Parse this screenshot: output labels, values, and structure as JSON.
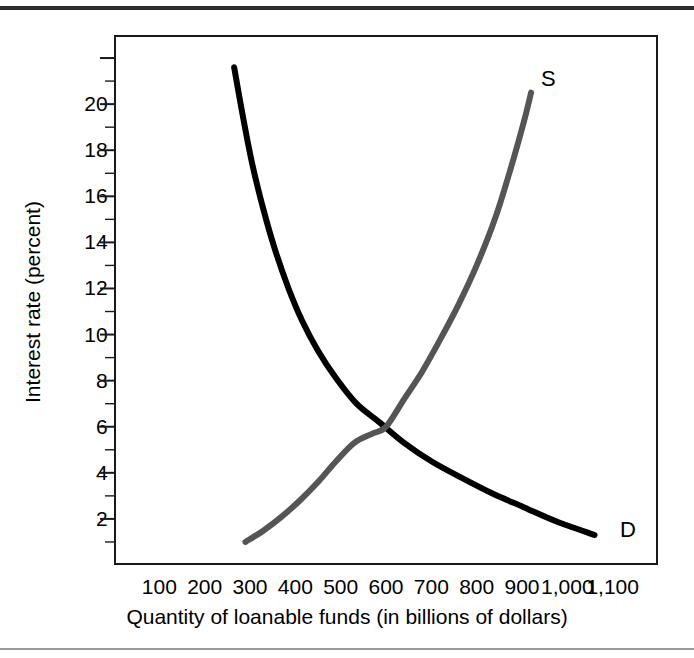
{
  "figure": {
    "background": "#ffffff",
    "frame_color": "#1a1a1a",
    "grid_color": "#4a4a4a",
    "rule_top_color": "#2e2e2e",
    "rule_bottom_color": "#9a9a9a"
  },
  "chart_data": {
    "type": "line",
    "title": "",
    "xlabel": "Quantity of loanable funds (in billions of dollars)",
    "ylabel": "Interest rate (percent)",
    "xlim": [
      0,
      1200
    ],
    "ylim": [
      0,
      23
    ],
    "grid": true,
    "grid_x_step": 50,
    "grid_y_step": 1,
    "legend": "inline-curve-labels",
    "xticks": [
      100,
      200,
      300,
      400,
      500,
      600,
      700,
      800,
      900,
      1000,
      1100
    ],
    "xtick_labels": [
      "100",
      "200",
      "300",
      "400",
      "500",
      "600",
      "700",
      "800",
      "900",
      "1,000",
      "1,100"
    ],
    "yticks": [
      2,
      4,
      6,
      8,
      10,
      12,
      14,
      16,
      18,
      20
    ],
    "ytick_labels": [
      "2",
      "4",
      "6",
      "8",
      "10",
      "12",
      "14",
      "16",
      "18",
      "20"
    ],
    "equilibrium": {
      "quantity": 600,
      "interest_rate": 6
    },
    "series": [
      {
        "name": "D",
        "label": "D",
        "description": "Demand for loanable funds",
        "color": "#000000",
        "width": 6,
        "points": [
          [
            265,
            21.6
          ],
          [
            285,
            19.4
          ],
          [
            305,
            17.4
          ],
          [
            330,
            15.4
          ],
          [
            355,
            13.7
          ],
          [
            385,
            12.0
          ],
          [
            415,
            10.6
          ],
          [
            450,
            9.3
          ],
          [
            490,
            8.1
          ],
          [
            535,
            7.0
          ],
          [
            585,
            6.2
          ],
          [
            640,
            5.3
          ],
          [
            700,
            4.5
          ],
          [
            765,
            3.8
          ],
          [
            835,
            3.1
          ],
          [
            905,
            2.5
          ],
          [
            975,
            1.9
          ],
          [
            1060,
            1.3
          ]
        ]
      },
      {
        "name": "S",
        "label": "S",
        "description": "Supply of loanable funds",
        "color": "#555555",
        "width": 6,
        "points": [
          [
            290,
            1.0
          ],
          [
            330,
            1.5
          ],
          [
            370,
            2.1
          ],
          [
            410,
            2.8
          ],
          [
            450,
            3.6
          ],
          [
            490,
            4.5
          ],
          [
            530,
            5.3
          ],
          [
            570,
            5.7
          ],
          [
            600,
            6.0
          ],
          [
            640,
            7.2
          ],
          [
            680,
            8.4
          ],
          [
            720,
            9.8
          ],
          [
            760,
            11.3
          ],
          [
            800,
            13.0
          ],
          [
            840,
            15.0
          ],
          [
            875,
            17.2
          ],
          [
            905,
            19.3
          ],
          [
            920,
            20.5
          ]
        ]
      }
    ]
  }
}
